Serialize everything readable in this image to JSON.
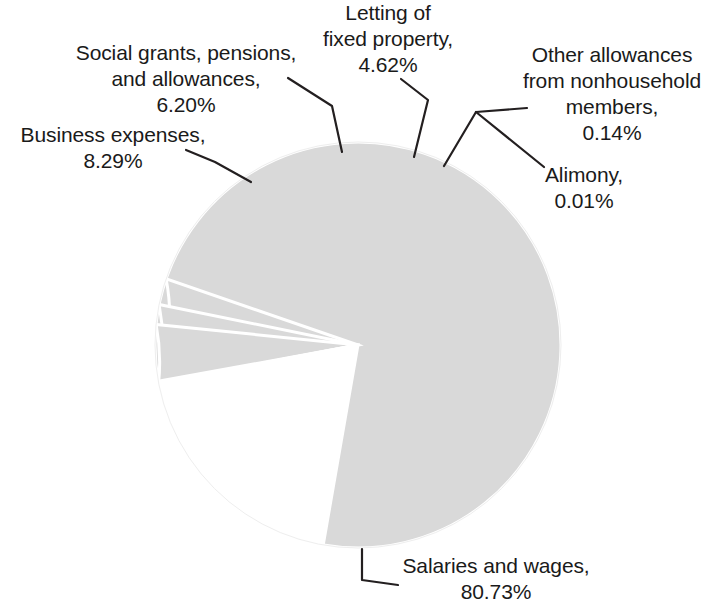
{
  "chart_data": {
    "type": "pie",
    "title": "",
    "subtitle": "",
    "xlabel": "",
    "ylabel": "",
    "legend_position": "none",
    "grid": false,
    "value_unit": "%",
    "categories": [
      "Business expenses",
      "Social grants, pensions, and allowances",
      "Letting of fixed property",
      "Other allowances from nonhousehold members",
      "Alimony",
      "Salaries and wages"
    ],
    "values": [
      8.29,
      6.2,
      4.62,
      0.14,
      0.01,
      80.73
    ],
    "slice_color": "#d9d9d9",
    "slice_border_color": "#ffffff",
    "leader_line_color": "#231f20"
  },
  "labels": {
    "business": {
      "name": "Business expenses,",
      "value": "8.29%",
      "text": "Business expenses,\n8.29%"
    },
    "social": {
      "name": "Social grants, pensions, and allowances,",
      "value": "6.20%",
      "text": "Social grants, pensions,\nand allowances,\n6.20%"
    },
    "letting": {
      "name": "Letting of fixed property,",
      "value": "4.62%",
      "text": "Letting of\nfixed property,\n4.62%"
    },
    "other": {
      "name": "Other allowances from nonhousehold members,",
      "value": "0.14%",
      "text": "Other allowances\nfrom nonhousehold\nmembers,\n0.14%"
    },
    "alimony": {
      "name": "Alimony,",
      "value": "0.01%",
      "text": "Alimony,\n0.01%"
    },
    "salaries": {
      "name": "Salaries and wages,",
      "value": "80.73%",
      "text": "Salaries and wages,\n80.73%"
    }
  }
}
